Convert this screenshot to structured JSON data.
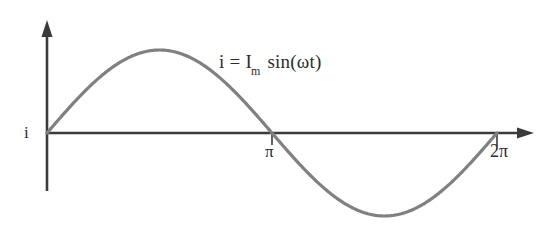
{
  "figure": {
    "background_color": "#ffffff",
    "axis_color": "#3a3a3a",
    "curve_color": "#808080",
    "text_color": "#2b2b2b"
  },
  "labels": {
    "y_axis_label": "i",
    "equation": {
      "lhs": "i",
      "equals": "=",
      "amplitude": "I",
      "amplitude_subscript": "m",
      "function": "sin(ωt)",
      "full_text": "i = Im sin(ωt)"
    },
    "x_ticks": [
      {
        "label": "π",
        "value": 3.14159
      },
      {
        "label": "2π",
        "value": 6.28318
      }
    ]
  },
  "chart_data": {
    "type": "line",
    "title": "",
    "subtitle": "",
    "xlabel": "",
    "ylabel": "i",
    "annotations": [
      "i = Im sin(ωt)"
    ],
    "legend": [],
    "legend_position": "none",
    "grid": false,
    "xlim": [
      0,
      6.8068
    ],
    "ylim": [
      -1.22,
      1.22
    ],
    "xticks": [
      3.14159,
      6.28318
    ],
    "xticklabels": [
      "π",
      "2π"
    ],
    "yticks": [],
    "yticklabels": [],
    "series": [
      {
        "name": "i = Im sin(ωt)",
        "color": "#808080",
        "x": [
          0,
          0.19635,
          0.3927,
          0.58905,
          0.7854,
          0.98175,
          1.1781,
          1.37445,
          1.5708,
          1.76715,
          1.9635,
          2.15984,
          2.35619,
          2.55254,
          2.74889,
          2.94524,
          3.14159,
          3.33794,
          3.53429,
          3.73064,
          3.92699,
          4.12334,
          4.31969,
          4.51604,
          4.71239,
          4.90874,
          5.10509,
          5.30144,
          5.49779,
          5.69414,
          5.89049,
          6.08684,
          6.28318
        ],
        "y": [
          0,
          0.19509,
          0.38268,
          0.55557,
          0.70711,
          0.83147,
          0.92388,
          0.98079,
          1.0,
          0.98079,
          0.92388,
          0.83147,
          0.70711,
          0.55557,
          0.38268,
          0.19509,
          0,
          -0.19509,
          -0.38268,
          -0.55557,
          -0.70711,
          -0.83147,
          -0.92388,
          -0.98079,
          -1.0,
          -0.98079,
          -0.92388,
          -0.83147,
          -0.70711,
          -0.55557,
          -0.38268,
          -0.19509,
          0
        ]
      }
    ]
  }
}
